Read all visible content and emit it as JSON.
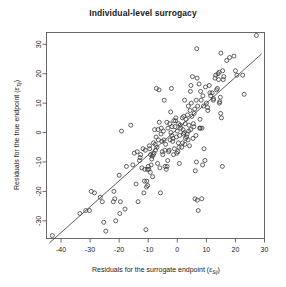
{
  "chart_data": {
    "type": "scatter",
    "title": "Individual-level surrogacy",
    "xlabel": "Residuals for the surrogate endpoint (",
    "xlabel_symbol": "ε",
    "xlabel_sub": "Sij",
    "xlabel_close": ")",
    "ylabel": "Residuals for the true endpoint  (",
    "ylabel_symbol": "ε",
    "ylabel_sub": "Tij",
    "ylabel_close": ")",
    "xlim": [
      -45,
      30
    ],
    "ylim": [
      -36,
      34
    ],
    "xticks": [
      -40,
      -30,
      -20,
      -10,
      0,
      10,
      20,
      30
    ],
    "yticks": [
      -30,
      -20,
      -10,
      0,
      10,
      20,
      30
    ],
    "grid": false,
    "legend": false,
    "point_marker": "open-circle",
    "point_color": "#3a3a3a",
    "line_color": "#4a4a4a",
    "fit_line": {
      "slope": 0.88,
      "intercept": 1.2,
      "x_start": -44,
      "x_end": 29
    },
    "x": [
      -43.0,
      -33.5,
      -30.2,
      -29.6,
      -28.5,
      -25.8,
      -25.3,
      -24.6,
      -21.5,
      -21.2,
      -20.0,
      -19.6,
      -19.2,
      -18.0,
      -15.3,
      -14.2,
      -13.8,
      -13.0,
      -12.6,
      -12.2,
      -11.8,
      -11.5,
      -11.2,
      -11.0,
      -10.8,
      -10.5,
      -10.2,
      -10.0,
      -9.8,
      -9.5,
      -9.2,
      -9.0,
      -8.8,
      -8.5,
      -8.2,
      -8.0,
      -7.8,
      -7.5,
      -7.2,
      -7.0,
      -6.8,
      -6.5,
      -6.2,
      -6.0,
      -5.8,
      -5.5,
      -5.2,
      -5.0,
      -4.8,
      -4.5,
      -4.2,
      -4.0,
      -3.8,
      -3.5,
      -3.2,
      -3.0,
      -2.8,
      -2.5,
      -2.2,
      -2.0,
      -1.8,
      -1.5,
      -1.2,
      -1.0,
      -0.8,
      -0.5,
      -0.2,
      0.0,
      0.2,
      0.5,
      0.8,
      1.0,
      1.2,
      1.5,
      1.8,
      2.0,
      2.2,
      2.5,
      2.8,
      3.0,
      3.2,
      3.5,
      3.8,
      4.0,
      4.2,
      4.5,
      4.8,
      5.0,
      5.2,
      5.5,
      5.8,
      6.0,
      6.2,
      6.5,
      6.8,
      7.0,
      7.2,
      7.5,
      7.8,
      8.0,
      8.2,
      8.5,
      8.8,
      9.0,
      9.5,
      10.0,
      10.5,
      11.0,
      11.5,
      12.0,
      12.5,
      13.0,
      13.5,
      14.0,
      14.2,
      14.5,
      14.8,
      15.0,
      15.2,
      15.5,
      16.0,
      17.0,
      18.0,
      19.5,
      20.0,
      22.5,
      23.0,
      27.2,
      -31.5,
      -26.5,
      -22.0,
      -17.5,
      -16.0,
      -12.8,
      -11.3,
      -10.3,
      -9.3,
      -8.3,
      -7.3,
      -6.3,
      -5.3,
      -4.3,
      -3.3,
      -2.3,
      -1.3,
      -0.3,
      0.7,
      1.7,
      2.7,
      3.7,
      4.7,
      5.7,
      6.7,
      7.7,
      8.7,
      9.7,
      11.2,
      13.2,
      14.6,
      15.6,
      -19.8,
      -14.8,
      -10.6,
      -7.6,
      -5.6,
      -3.6,
      -1.6,
      0.4,
      2.4,
      4.4,
      6.4,
      8.4,
      10.4,
      12.4,
      14.4,
      6.6,
      6.9,
      5.4,
      -2.6,
      -4.6,
      0.6,
      3.4,
      9.2,
      13.8,
      15.8,
      4.6,
      -6.6,
      -9.6,
      2.6,
      -0.6,
      -21.8,
      -8.6,
      6.1,
      14.9,
      20.5,
      3.9,
      -1.9,
      -13.5,
      7.9,
      2.1
    ],
    "y": [
      -35.0,
      -27.5,
      -26.5,
      -20.0,
      -20.5,
      -23.5,
      -30.5,
      -33.5,
      -22.5,
      -30.0,
      -14.5,
      -23.5,
      0.5,
      -26.0,
      -11.0,
      -17.5,
      -6.5,
      -9.5,
      -7.5,
      -12.0,
      -5.5,
      -20.5,
      -12.5,
      -6.0,
      -33.0,
      -16.5,
      -18.0,
      -11.5,
      -12.5,
      -5.5,
      -7.5,
      -11.0,
      -9.0,
      -15.0,
      -3.5,
      -7.0,
      1.0,
      -6.0,
      15.0,
      -5.0,
      -10.5,
      -2.5,
      3.5,
      -12.0,
      -20.5,
      1.5,
      -6.5,
      -7.5,
      0.5,
      11.0,
      -11.5,
      -4.0,
      -12.5,
      -11.5,
      1.5,
      -6.5,
      -6.0,
      -2.5,
      0.0,
      15.0,
      2.0,
      -2.0,
      4.0,
      -5.5,
      2.0,
      5.0,
      -7.0,
      0.5,
      -6.5,
      3.0,
      -1.0,
      2.5,
      1.5,
      -5.0,
      -3.5,
      1.0,
      5.5,
      11.0,
      -2.0,
      4.5,
      -1.5,
      6.0,
      9.0,
      2.5,
      -4.5,
      14.0,
      10.0,
      5.5,
      19.0,
      3.0,
      6.5,
      8.0,
      -13.0,
      11.0,
      18.5,
      9.0,
      -26.5,
      16.5,
      4.5,
      14.0,
      11.0,
      1.5,
      12.5,
      9.0,
      -9.5,
      10.0,
      7.5,
      16.0,
      12.5,
      13.5,
      11.5,
      18.5,
      14.5,
      20.0,
      18.0,
      10.0,
      12.0,
      27.0,
      5.0,
      -11.5,
      19.0,
      24.5,
      25.5,
      26.0,
      21.0,
      19.5,
      13.0,
      33.0,
      -26.5,
      -22.0,
      -23.5,
      -11.5,
      2.5,
      -8.5,
      -16.5,
      -12.5,
      -13.5,
      -7.5,
      -1.5,
      14.5,
      -3.0,
      -6.0,
      -9.5,
      7.0,
      -7.5,
      -1.5,
      -10.5,
      5.0,
      3.0,
      -2.5,
      16.0,
      2.0,
      28.5,
      1.5,
      -11.0,
      15.5,
      13.5,
      19.5,
      10.5,
      21.0,
      -27.5,
      -7.0,
      -18.5,
      -4.0,
      -0.5,
      3.5,
      -3.0,
      -3.5,
      0.0,
      7.5,
      -1.0,
      -22.5,
      8.5,
      11.0,
      20.5,
      -10.0,
      -23.0,
      -2.0,
      3.0,
      -2.5,
      -5.0,
      -0.5,
      -5.5,
      15.0,
      18.0,
      1.0,
      1.0,
      -4.5,
      -4.0,
      4.0,
      -20.0,
      -8.0,
      -22.5,
      6.5,
      19.5,
      0.5,
      -1.0,
      -23.5,
      1.5,
      -0.5
    ]
  }
}
